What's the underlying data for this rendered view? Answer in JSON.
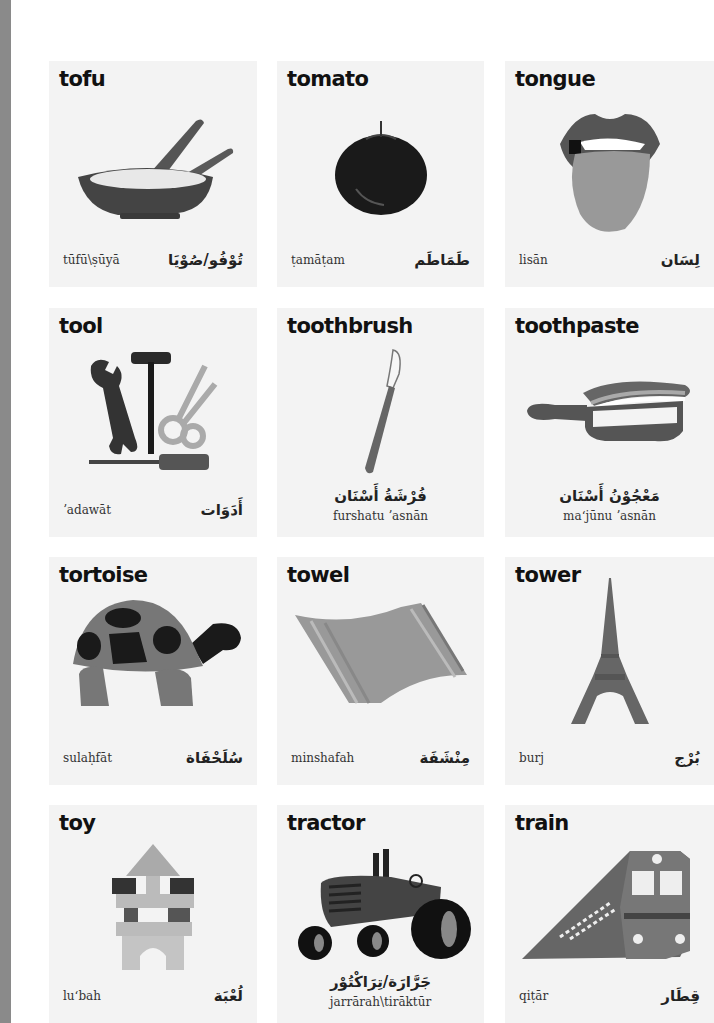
{
  "page": {
    "background": "#ffffff",
    "spine_color": "#8a8a8a",
    "card_background": "#f3f3f3"
  },
  "cards": [
    {
      "id": "tofu",
      "english": "tofu",
      "transliteration": "tūfū\\ṣūyā",
      "arabic": "تُوْفُو/صُوْيَا",
      "icon": "tofu-bowl-icon",
      "layout": "split"
    },
    {
      "id": "tomato",
      "english": "tomato",
      "transliteration": "ṭamāṭam",
      "arabic": "طَمَاطَم",
      "icon": "tomato-icon",
      "layout": "split"
    },
    {
      "id": "tongue",
      "english": "tongue",
      "transliteration": "lisān",
      "arabic": "لِسَان",
      "icon": "tongue-icon",
      "layout": "split"
    },
    {
      "id": "tool",
      "english": "tool",
      "transliteration": "ʼadawāt",
      "arabic": "أَدَوَات",
      "icon": "tools-icon",
      "layout": "split"
    },
    {
      "id": "toothbrush",
      "english": "toothbrush",
      "transliteration": "furshatu ʼasnān",
      "arabic": "فُرْشَةُ أَسْنَان",
      "icon": "toothbrush-icon",
      "layout": "centered"
    },
    {
      "id": "toothpaste",
      "english": "toothpaste",
      "transliteration": "maʻjūnu ʼasnān",
      "arabic": "مَعْجُوْنُ أَسْنَان",
      "icon": "toothpaste-icon",
      "layout": "centered"
    },
    {
      "id": "tortoise",
      "english": "tortoise",
      "transliteration": "sulaḥfāt",
      "arabic": "سُلَحْفَاة",
      "icon": "tortoise-icon",
      "layout": "split"
    },
    {
      "id": "towel",
      "english": "towel",
      "transliteration": "minshafah",
      "arabic": "مِنْشَفَة",
      "icon": "towel-icon",
      "layout": "split"
    },
    {
      "id": "tower",
      "english": "tower",
      "transliteration": "burj",
      "arabic": "بُرْج",
      "icon": "eiffel-tower-icon",
      "layout": "split"
    },
    {
      "id": "toy",
      "english": "toy",
      "transliteration": "luʻbah",
      "arabic": "لُعْبَة",
      "icon": "toy-blocks-icon",
      "layout": "split"
    },
    {
      "id": "tractor",
      "english": "tractor",
      "transliteration": "jarrārah\\tirāktūr",
      "arabic": "جَرَّارَة/تِرَاكْتُوْر",
      "icon": "tractor-icon",
      "layout": "centered"
    },
    {
      "id": "train",
      "english": "train",
      "transliteration": "qiṭār",
      "arabic": "قِطَار",
      "icon": "train-icon",
      "layout": "split"
    }
  ]
}
